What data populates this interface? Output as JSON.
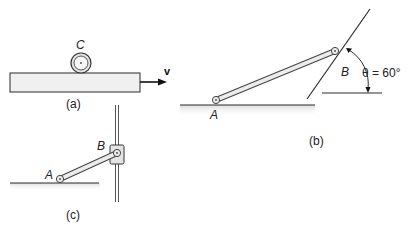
{
  "figure_a": {
    "caption": "(a)",
    "wheel_label": "C",
    "velocity_label": "v"
  },
  "figure_b": {
    "caption": "(b)",
    "point_a_label": "A",
    "point_b_label": "B",
    "angle_label": "θ = 60°"
  },
  "figure_c": {
    "caption": "(c)",
    "point_a_label": "A",
    "point_b_label": "B"
  },
  "colors": {
    "line": "#2a2a2a",
    "plate_fill": "#efefef",
    "link_fill": "#e8e8e8",
    "shadow": "#d9d9d9"
  }
}
